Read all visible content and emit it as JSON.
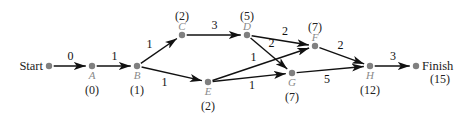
{
  "diagram": {
    "nodes": [
      {
        "id": "Start",
        "name": "Start",
        "time": "",
        "terminal": true
      },
      {
        "id": "A",
        "name": "A",
        "time": "(0)"
      },
      {
        "id": "B",
        "name": "B",
        "time": "(1)"
      },
      {
        "id": "C",
        "name": "C",
        "time": "(2)"
      },
      {
        "id": "D",
        "name": "D",
        "time": "(5)"
      },
      {
        "id": "E",
        "name": "E",
        "time": "(2)"
      },
      {
        "id": "F",
        "name": "F",
        "time": "(7)"
      },
      {
        "id": "G",
        "name": "G",
        "time": "(7)"
      },
      {
        "id": "H",
        "name": "H",
        "time": "(12)"
      },
      {
        "id": "Finish",
        "name": "Finish",
        "time": "(15)",
        "terminal": true
      }
    ],
    "edges": [
      {
        "from": "Start",
        "to": "A",
        "weight": "0"
      },
      {
        "from": "A",
        "to": "B",
        "weight": "1"
      },
      {
        "from": "B",
        "to": "C",
        "weight": "1"
      },
      {
        "from": "B",
        "to": "E",
        "weight": "1"
      },
      {
        "from": "C",
        "to": "D",
        "weight": "3"
      },
      {
        "from": "D",
        "to": "F",
        "weight": "2"
      },
      {
        "from": "D",
        "to": "G",
        "weight": "2"
      },
      {
        "from": "E",
        "to": "F",
        "weight": "1"
      },
      {
        "from": "E",
        "to": "G",
        "weight": "1"
      },
      {
        "from": "F",
        "to": "H",
        "weight": "2"
      },
      {
        "from": "G",
        "to": "H",
        "weight": "5"
      },
      {
        "from": "H",
        "to": "Finish",
        "weight": "3"
      }
    ]
  }
}
